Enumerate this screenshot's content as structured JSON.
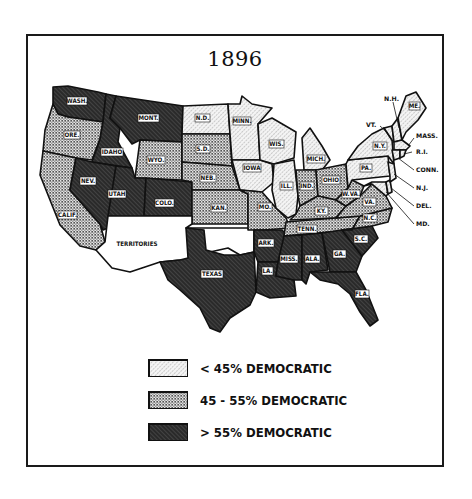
{
  "map": {
    "title": "1896",
    "legend": [
      {
        "key": "low",
        "label": "< 45% DEMOCRATIC",
        "pattern": "light-hatch"
      },
      {
        "key": "mid",
        "label": "45 - 55% DEMOCRATIC",
        "pattern": "checker"
      },
      {
        "key": "high",
        "label": "> 55% DEMOCRATIC",
        "pattern": "dark-hatch"
      }
    ],
    "states": {
      "WASH": {
        "label": "WASH.",
        "category": "high"
      },
      "ORE": {
        "label": "ORE.",
        "category": "mid"
      },
      "CALIF": {
        "label": "CALIF.",
        "category": "mid"
      },
      "IDAHO": {
        "label": "IDAHO",
        "category": "high"
      },
      "NEV": {
        "label": "NEV.",
        "category": "high"
      },
      "MONT": {
        "label": "MONT.",
        "category": "high"
      },
      "WYO": {
        "label": "WYO.",
        "category": "mid"
      },
      "UTAH": {
        "label": "UTAH",
        "category": "high"
      },
      "COLO": {
        "label": "COLO.",
        "category": "high"
      },
      "ND": {
        "label": "N.D.",
        "category": "low"
      },
      "SD": {
        "label": "S.D.",
        "category": "mid"
      },
      "NEB": {
        "label": "NEB.",
        "category": "mid"
      },
      "KAN": {
        "label": "KAN.",
        "category": "mid"
      },
      "TERR": {
        "label": "TERRITORIES",
        "category": "none"
      },
      "TEXAS": {
        "label": "TEXAS",
        "category": "high"
      },
      "MINN": {
        "label": "MINN.",
        "category": "low"
      },
      "IOWA": {
        "label": "IOWA",
        "category": "low"
      },
      "MO": {
        "label": "MO.",
        "category": "mid"
      },
      "ARK": {
        "label": "ARK.",
        "category": "high"
      },
      "LA": {
        "label": "LA.",
        "category": "high"
      },
      "WIS": {
        "label": "WIS.",
        "category": "low"
      },
      "ILL": {
        "label": "ILL.",
        "category": "low"
      },
      "MICH": {
        "label": "MICH.",
        "category": "low"
      },
      "IND": {
        "label": "IND.",
        "category": "mid"
      },
      "OHIO": {
        "label": "OHIO",
        "category": "mid"
      },
      "KY": {
        "label": "KY.",
        "category": "mid"
      },
      "TENN": {
        "label": "TENN.",
        "category": "mid"
      },
      "MISS": {
        "label": "MISS.",
        "category": "high"
      },
      "ALA": {
        "label": "ALA.",
        "category": "high"
      },
      "GA": {
        "label": "GA.",
        "category": "high"
      },
      "FLA": {
        "label": "FLA.",
        "category": "high"
      },
      "SC": {
        "label": "S.C.",
        "category": "high"
      },
      "NC": {
        "label": "N.C.",
        "category": "mid"
      },
      "VA": {
        "label": "VA.",
        "category": "mid"
      },
      "WVA": {
        "label": "W.VA.",
        "category": "mid"
      },
      "PA": {
        "label": "PA.",
        "category": "low"
      },
      "NY": {
        "label": "N.Y.",
        "category": "low"
      },
      "VT": {
        "label": "VT.",
        "category": "low"
      },
      "NH": {
        "label": "N.H.",
        "category": "low"
      },
      "ME": {
        "label": "ME.",
        "category": "low"
      },
      "MASS": {
        "label": "MASS.",
        "category": "low"
      },
      "RI": {
        "label": "R.I.",
        "category": "low"
      },
      "CONN": {
        "label": "CONN.",
        "category": "low"
      },
      "NJ": {
        "label": "N.J.",
        "category": "low"
      },
      "DEL": {
        "label": "DEL.",
        "category": "low"
      },
      "MD": {
        "label": "MD.",
        "category": "low"
      }
    }
  }
}
